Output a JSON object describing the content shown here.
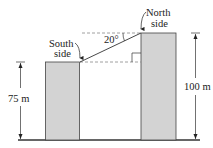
{
  "diagram": {
    "labels": {
      "south_line1": "South",
      "south_line2": "side",
      "north_line1": "North",
      "north_line2": "side",
      "angle": "20°",
      "left_height": "75 m",
      "right_height": "100 m"
    },
    "colors": {
      "building_fill": "#d3d3d3",
      "stroke": "#333333",
      "dashed": "#888888"
    }
  }
}
